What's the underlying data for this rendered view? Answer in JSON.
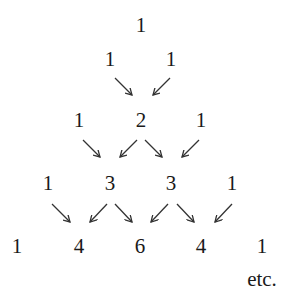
{
  "diagram": {
    "rows": [
      [
        "1"
      ],
      [
        "1",
        "1"
      ],
      [
        "1",
        "2",
        "1"
      ],
      [
        "1",
        "3",
        "3",
        "1"
      ],
      [
        "1",
        "4",
        "6",
        "4",
        "1"
      ]
    ],
    "continuation": "etc.",
    "arrow_color": "#333333",
    "text_color": "#1a1a1a"
  }
}
